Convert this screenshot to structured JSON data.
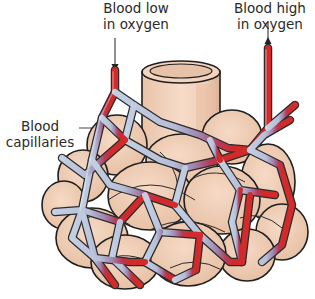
{
  "diagram": {
    "labels": {
      "blood_low": {
        "line1": "Blood low",
        "line2": "in oxygen"
      },
      "blood_high": {
        "line1": "Blood high",
        "line2": "in oxygen"
      },
      "capillaries": {
        "line1": "Blood",
        "line2": "capillaries"
      }
    },
    "colors": {
      "deoxygenated": "#b9c6da",
      "mixed": "#a48cb4",
      "oxygenated": "#d42a2a",
      "alveolus": "#f1cdb3",
      "outline": "#1e1e1e",
      "text": "#2a2a2a"
    },
    "arrows": [
      {
        "id": "inflow-arrow",
        "direction": "down",
        "meaning": "Blood low in oxygen enters"
      },
      {
        "id": "outflow-arrow",
        "direction": "up",
        "meaning": "Blood high in oxygen leaves"
      }
    ]
  }
}
